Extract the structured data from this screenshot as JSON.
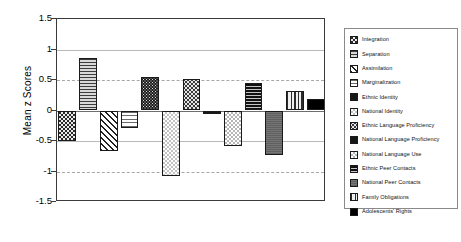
{
  "chart_data": {
    "type": "bar",
    "title": "",
    "xlabel": "",
    "ylabel": "Mean z Scores",
    "ylim": [
      -1.5,
      1.5
    ],
    "yticks": [
      "1.5",
      "1",
      "0.5",
      "0",
      "-0.5",
      "-1",
      "-1.5"
    ],
    "ytick_values": [
      1.5,
      1,
      0.5,
      0,
      -0.5,
      -1,
      -1.5
    ],
    "grid": true,
    "legend_position": "right",
    "categories": [
      "Integration",
      "Separation",
      "Assimilation",
      "Marginalization",
      "Ethnic Identity",
      "National Identity",
      "Ethnic Language Proficiency",
      "National Language Proficiency",
      "National Language Use",
      "Ethnic Peer Contacts",
      "National Peer Contacts",
      "Family Obligations",
      "Adolescents' Rights"
    ],
    "values": [
      -0.5,
      0.86,
      -0.66,
      -0.29,
      0.55,
      -1.08,
      0.51,
      -0.06,
      -0.58,
      0.45,
      -0.73,
      0.32,
      0.19
    ],
    "bars": [
      {
        "label": "Integration",
        "value": -0.5,
        "pattern": "checker-dark"
      },
      {
        "label": "Separation",
        "value": 0.86,
        "pattern": "hline-light"
      },
      {
        "label": "Assimilation",
        "value": -0.66,
        "pattern": "diagonal-hatch"
      },
      {
        "label": "Marginalization",
        "value": -0.29,
        "pattern": "hline-very-light"
      },
      {
        "label": "Ethnic Identity",
        "value": 0.55,
        "pattern": "dots-dark"
      },
      {
        "label": "National Identity",
        "value": -1.08,
        "pattern": "checker-light"
      },
      {
        "label": "Ethnic Language Proficiency",
        "value": 0.51,
        "pattern": "dots-medium"
      },
      {
        "label": "National Language Proficiency",
        "value": -0.06,
        "pattern": "solid-dark"
      },
      {
        "label": "National Language Use",
        "value": -0.58,
        "pattern": "checker-light-2"
      },
      {
        "label": "Ethnic Peer Contacts",
        "value": 0.45,
        "pattern": "hline-dark"
      },
      {
        "label": "National Peer Contacts",
        "value": -0.73,
        "pattern": "solid-gray"
      },
      {
        "label": "Family Obligations",
        "value": 0.32,
        "pattern": "vline"
      },
      {
        "label": "Adolescents' Rights",
        "value": 0.19,
        "pattern": "solid-black"
      }
    ]
  },
  "axis": {
    "y_title": "Mean z Scores"
  },
  "legend": {
    "items": [
      {
        "label": "Integration",
        "pattern": "checker-dark"
      },
      {
        "label": "Separation",
        "pattern": "hline-light"
      },
      {
        "label": "Assimilation",
        "pattern": "diagonal-hatch"
      },
      {
        "label": "Marginalization",
        "pattern": "hline-very-light"
      },
      {
        "label": "Ethnic Identity",
        "pattern": "solid-dark"
      },
      {
        "label": "National Identity",
        "pattern": "checker-light"
      },
      {
        "label": "Ethnic Language Proficiency",
        "pattern": "dots-medium"
      },
      {
        "label": "National Language Proficiency",
        "pattern": "solid-dark"
      },
      {
        "label": "National Language Use",
        "pattern": "checker-light-2"
      },
      {
        "label": "Ethnic Peer Contacts",
        "pattern": "hline-dark"
      },
      {
        "label": "National Peer Contacts",
        "pattern": "solid-gray"
      },
      {
        "label": "Family Obligations",
        "pattern": "vline"
      },
      {
        "label": "Adolescents' Rights",
        "pattern": "solid-black"
      }
    ]
  },
  "colors": {
    "frame": "#3a3a3a",
    "gridline": "#b9b9b9",
    "zero_line": "#6e6e6e",
    "legend_border": "#8a8a8a",
    "background": "#ffffff",
    "text": "#000000"
  }
}
